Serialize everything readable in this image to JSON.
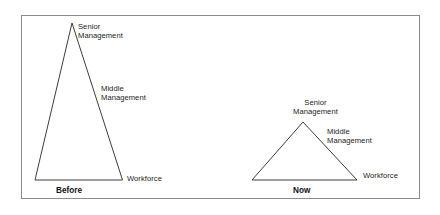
{
  "diagram": {
    "type": "organizational-pyramid-comparison",
    "background_color": "#ffffff",
    "frame_color": "#8b8b8b",
    "line_color": "#3d3d3d",
    "text_color": "#1c1c1c",
    "panels": [
      {
        "id": "before",
        "caption": "Before",
        "shape": "tall-narrow-triangle",
        "labels": {
          "top": "Senior\nManagement",
          "top_line1": "Senior",
          "top_line2": "Management",
          "middle_line1": "Middle",
          "middle_line2": "Management",
          "base": "Workforce"
        }
      },
      {
        "id": "now",
        "caption": "Now",
        "shape": "short-wide-triangle",
        "labels": {
          "top_line1": "Senior",
          "top_line2": "Management",
          "middle_line1": "Middle",
          "middle_line2": "Management",
          "base": "Workforce"
        }
      }
    ]
  }
}
